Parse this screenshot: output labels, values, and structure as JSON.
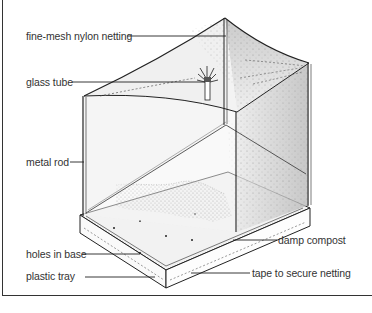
{
  "diagram": {
    "labels": {
      "netting": "fine-mesh nylon netting",
      "glass_tube": "glass tube",
      "metal_rod": "metal rod",
      "holes": "holes in base",
      "tray": "plastic tray",
      "compost": "damp compost",
      "tape": "tape to secure netting"
    },
    "colors": {
      "line": "#222222",
      "label_text": "#333333",
      "mesh_shade": "#9a9a9a",
      "compost": "#6b6b6b",
      "background": "#ffffff"
    }
  }
}
